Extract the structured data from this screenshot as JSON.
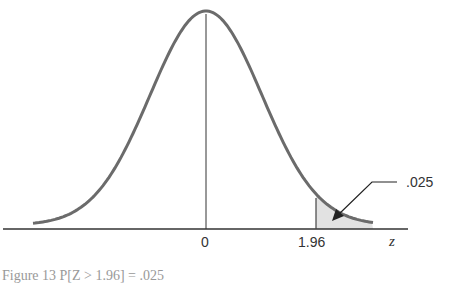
{
  "chart_data": {
    "type": "area",
    "title": "",
    "distribution": "standard normal",
    "xlabel": "z",
    "ylabel": "",
    "tick_labels": [
      "0",
      "1.96"
    ],
    "x_ticks": [
      0,
      1.96
    ],
    "shaded_region": {
      "from": 1.96,
      "to": "inf",
      "area": 0.025
    },
    "annotation": ".025",
    "grid": false,
    "legend": null
  },
  "labels": {
    "zero": "0",
    "critical": "1.96",
    "axis": "z",
    "area": ".025"
  },
  "caption": "Figure 13  P[Z > 1.96] = .025",
  "colors": {
    "curve": "#6b6b6b",
    "axis": "#333333",
    "shade": "#e2e2e2"
  }
}
